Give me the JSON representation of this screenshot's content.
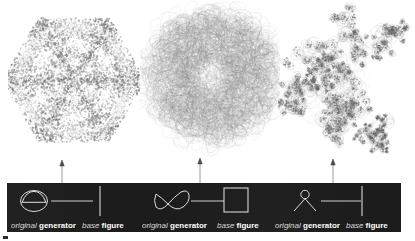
{
  "figure": {
    "background_color": "#ffffff",
    "panel_color": "#1c1c1c",
    "panel_text_color": "#ffffff",
    "stroke_color": "#8a8a8a"
  },
  "gallery": {
    "items": [
      {
        "name": "hexagonal-fractal",
        "description": "dense hexagonal fractal tiling built from circular generator",
        "seed": 11,
        "symmetry": 6,
        "style": "hexagon"
      },
      {
        "name": "rosette-fractal",
        "description": "tangled rosette of overlapping loops from figure-eight generator",
        "seed": 37,
        "symmetry": 12,
        "style": "rosette"
      },
      {
        "name": "dendritic-fractal",
        "description": "sparse dendritic cluster of rings from stick-figure generator",
        "seed": 73,
        "symmetry": 5,
        "style": "dendrite"
      }
    ]
  },
  "arrows": [
    {
      "name": "arrow-to-hexagonal-fractal",
      "x": 62,
      "from_y": 188,
      "to_y": 160
    },
    {
      "name": "arrow-to-rosette-fractal",
      "x": 200,
      "from_y": 188,
      "to_y": 158
    },
    {
      "name": "arrow-to-dendritic-fractal",
      "x": 333,
      "from_y": 188,
      "to_y": 159
    }
  ],
  "legend": {
    "groups": [
      {
        "name": "legend-group-1",
        "generator_glyph": "circle-with-dome-icon",
        "base_figure_glyph": "vertical-segment-icon",
        "generator_label_italic": "original",
        "generator_label_bold": "generator",
        "base_label_italic": "base",
        "base_label_bold": "figure"
      },
      {
        "name": "legend-group-2",
        "generator_glyph": "figure-eight-icon",
        "base_figure_glyph": "square-outline-icon",
        "generator_label_italic": "original",
        "generator_label_bold": "generator",
        "base_label_italic": "base",
        "base_label_bold": "figure"
      },
      {
        "name": "legend-group-3",
        "generator_glyph": "stick-figure-icon",
        "base_figure_glyph": "vertical-segment-icon",
        "generator_label_italic": "original",
        "generator_label_bold": "generator",
        "base_label_italic": "base",
        "base_label_bold": "figure"
      }
    ]
  }
}
